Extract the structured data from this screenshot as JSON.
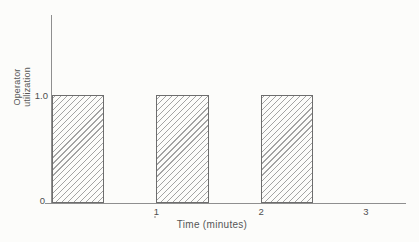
{
  "figure": {
    "background_color": "#fcfcfa",
    "axis_color": "#8f8f8f",
    "bar_border_color": "#6d6d6d",
    "hatch_color": "#a3a3a3",
    "text_color": "#525252"
  },
  "chart_data": {
    "type": "bar",
    "title": "",
    "xlabel": "Time (minutes)",
    "ylabel": "Operator utilization",
    "ylabel_lines": [
      "Operator",
      "utilization"
    ],
    "origin_label": "0",
    "y_tick_label": "1.0",
    "y_tick_value": 1.0,
    "x_ticks": [
      "1",
      "2",
      "3"
    ],
    "x_tick_values": [
      1,
      2,
      3
    ],
    "xlim": [
      0,
      3.45
    ],
    "ylim": [
      0,
      1.75
    ],
    "grid": false,
    "legend": null,
    "hatch": "forward-diagonal",
    "bars": [
      {
        "start": 0,
        "end": 0.5,
        "value": 1.0
      },
      {
        "start": 1,
        "end": 1.5,
        "value": 1.0
      },
      {
        "start": 2,
        "end": 2.5,
        "value": 1.0
      }
    ]
  }
}
